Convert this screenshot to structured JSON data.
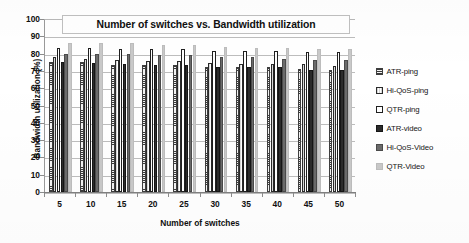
{
  "chart_data": {
    "type": "bar",
    "title": "Number of switches vs. Bandwidth utilization",
    "xlabel": "Number of switches",
    "ylabel": "Bandwidth utilization (%)",
    "categories": [
      "5",
      "10",
      "15",
      "20",
      "25",
      "30",
      "35",
      "40",
      "45",
      "50"
    ],
    "ylim": [
      0,
      100
    ],
    "ytick_labels": [
      "100",
      "90",
      "80",
      "70",
      "60",
      "50",
      "40",
      "30",
      "20",
      "10",
      "0"
    ],
    "yticks": [
      100,
      90,
      80,
      70,
      60,
      50,
      40,
      30,
      20,
      10,
      0
    ],
    "grid": true,
    "legend_position": "right",
    "series": [
      {
        "name": "ATR-ping",
        "color": "#e8e8e8",
        "pattern": "horizontal-hatch",
        "values": [
          75,
          75,
          73.5,
          73.5,
          73.5,
          72.5,
          72.5,
          72.5,
          71,
          70.5
        ]
      },
      {
        "name": "Hi-QoS-ping",
        "color": "#ffffff",
        "pattern": "vertical-lines",
        "values": [
          78,
          77,
          76.5,
          76,
          75.5,
          74.5,
          74,
          74,
          74,
          73
        ]
      },
      {
        "name": "QTR-ping",
        "color": "#ffffff",
        "pattern": "solid-outline",
        "values": [
          83.5,
          83,
          82.5,
          82.5,
          82.5,
          81.5,
          81.5,
          81.5,
          81,
          81
        ]
      },
      {
        "name": "ATR-video",
        "color": "#2b2b2b",
        "pattern": "solid",
        "values": [
          75,
          74.5,
          74,
          73.5,
          73.5,
          72.5,
          72,
          72,
          70.5,
          70.5
        ]
      },
      {
        "name": "Hi-QoS-Video",
        "color": "#6b6b6b",
        "pattern": "solid",
        "values": [
          79.5,
          79.5,
          79.5,
          79,
          79,
          78,
          78,
          77,
          76.5,
          76.5
        ]
      },
      {
        "name": "QTR-Video",
        "color": "#c9c9c9",
        "pattern": "solid",
        "values": [
          86,
          86,
          86,
          85,
          85,
          84,
          83.5,
          83,
          82.5,
          82.5
        ]
      }
    ]
  }
}
